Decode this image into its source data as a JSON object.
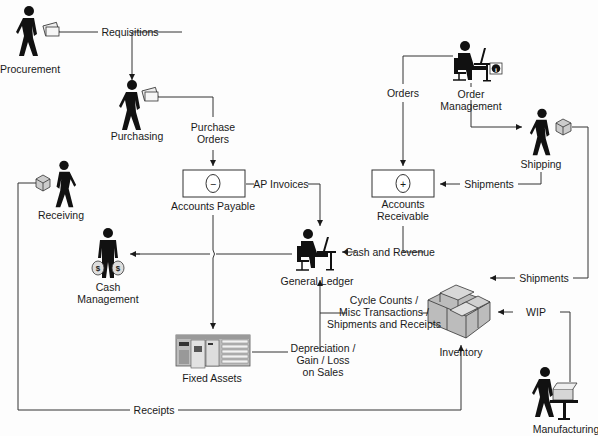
{
  "nodes": {
    "procurement": "Procurement",
    "purchasing": "Purchasing",
    "accounts_payable": "Accounts Payable",
    "order_management": [
      "Order",
      "Management"
    ],
    "shipping": "Shipping",
    "accounts_receivable": [
      "Accounts",
      "Receivable"
    ],
    "receiving": "Receiving",
    "cash_management": [
      "Cash",
      "Management"
    ],
    "general_ledger": "General Ledger",
    "fixed_assets": "Fixed Assets",
    "inventory": "Inventory",
    "manufacturing": "Manufacturing"
  },
  "flows": {
    "requisitions": "Requisitions",
    "purchase_orders": [
      "Purchase",
      "Orders"
    ],
    "ap_invoices": "AP Invoices",
    "orders": "Orders",
    "shipments_ar": "Shipments",
    "cash_and_revenue": "Cash and Revenue",
    "shipments_inv": "Shipments",
    "cycle_counts": [
      "Cycle Counts /",
      "Misc Transactions /",
      "Shipments and Receipts"
    ],
    "depreciation": [
      "Depreciation /",
      "Gain / Loss",
      "on Sales"
    ],
    "wip": "WIP",
    "receipts": "Receipts"
  },
  "symbols": {
    "ap_symbol": "−",
    "ar_symbol": "+",
    "info_symbol": "i",
    "dollar_symbol": "$"
  }
}
